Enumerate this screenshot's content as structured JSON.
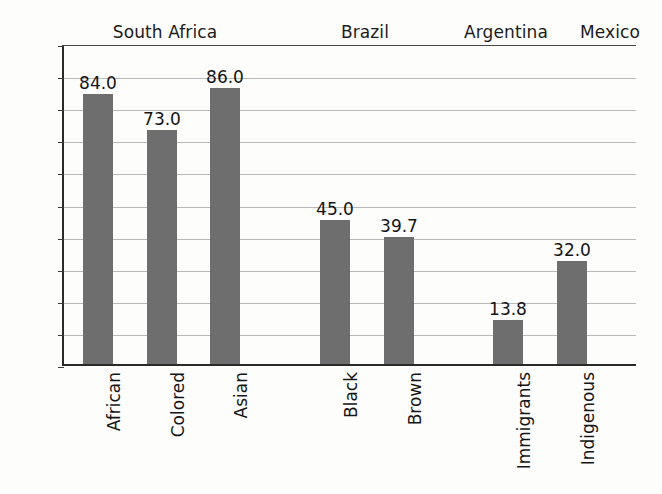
{
  "chart_data": {
    "type": "bar",
    "title": "",
    "subtitle": "",
    "xlabel": "",
    "ylabel": "",
    "ylim": [
      0,
      100
    ],
    "ytick_step": 10,
    "yticks": [
      "100",
      "90",
      "80",
      "70",
      "60",
      "50",
      "40",
      "30",
      "20",
      "10",
      "0"
    ],
    "grid": true,
    "legend": "none",
    "bar_color": "#6e6e6e",
    "categories": [
      "African",
      "Colored",
      "Asian",
      "Black",
      "Brown",
      "Immigrants",
      "Indigenous"
    ],
    "values": [
      84.0,
      73.0,
      86.0,
      45.0,
      39.7,
      13.8,
      32.0
    ],
    "value_labels": [
      "84.0",
      "73.0",
      "86.0",
      "45.0",
      "39.7",
      "13.8",
      "32.0"
    ],
    "groups": [
      {
        "label": "South Africa",
        "categories": [
          "African",
          "Colored",
          "Asian"
        ]
      },
      {
        "label": "Brazil",
        "categories": [
          "Black",
          "Brown"
        ]
      },
      {
        "label": "Argentina",
        "categories": [
          "Immigrants"
        ]
      },
      {
        "label": "Mexico",
        "categories": [
          "Indigenous"
        ]
      }
    ],
    "bars": [
      {
        "category": "African",
        "value": 84.0,
        "label": "84.0",
        "group": "South Africa"
      },
      {
        "category": "Colored",
        "value": 73.0,
        "label": "73.0",
        "group": "South Africa"
      },
      {
        "category": "Asian",
        "value": 86.0,
        "label": "86.0",
        "group": "South Africa"
      },
      {
        "category": "Black",
        "value": 45.0,
        "label": "45.0",
        "group": "Brazil"
      },
      {
        "category": "Brown",
        "value": 39.7,
        "label": "39.7",
        "group": "Brazil"
      },
      {
        "category": "Immigrants",
        "value": 13.8,
        "label": "13.8",
        "group": "Argentina"
      },
      {
        "category": "Indigenous",
        "value": 32.0,
        "label": "32.0",
        "group": "Mexico"
      }
    ]
  },
  "axis": {
    "y_labels": [
      "100",
      "90",
      "80",
      "70",
      "60",
      "50",
      "40",
      "30",
      "20",
      "10",
      "0"
    ]
  },
  "groups": {
    "g0": "South Africa",
    "g1": "Brazil",
    "g2": "Argentina",
    "g3": "Mexico"
  }
}
